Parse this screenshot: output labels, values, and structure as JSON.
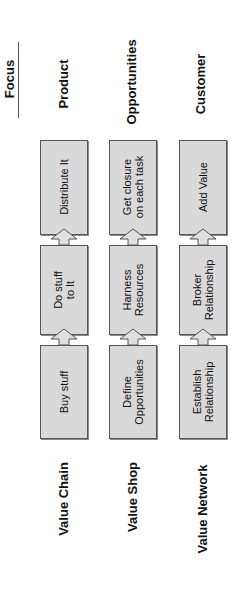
{
  "header": {
    "focus_label": "Focus"
  },
  "columns": [
    {
      "model": "Value Chain",
      "focus": "Product",
      "steps": [
        "Distribute It",
        "Do stuff\nto It",
        "Buy stuff"
      ]
    },
    {
      "model": "Value Shop",
      "focus": "Opportunities",
      "steps": [
        "Get closure\non each task",
        "Harness\nResources",
        "Define\nOpportunities"
      ]
    },
    {
      "model": "Value Network",
      "focus": "Customer",
      "steps": [
        "Add Value",
        "Broker\nRelationship",
        "Establish\nRelationship"
      ]
    }
  ],
  "colors": {
    "box_fill": "#d9d9d9",
    "box_border": "#555555",
    "arrow_fill": "#e0e0e0"
  }
}
